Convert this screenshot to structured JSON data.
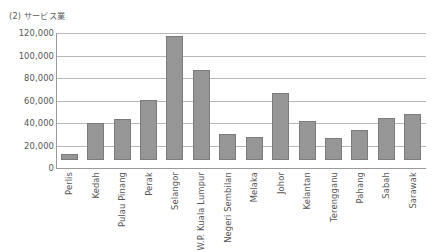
{
  "chart_data": {
    "type": "bar",
    "title": "(2) サービス業",
    "xlabel": "",
    "ylabel": "",
    "ylim": [
      0,
      120000
    ],
    "ytick_labels": [
      "120,000",
      "100,000",
      "80,000",
      "60,000",
      "40,000",
      "20,000",
      "0"
    ],
    "ytick_values": [
      120000,
      100000,
      80000,
      60000,
      40000,
      20000,
      0
    ],
    "grid": true,
    "legend": "none",
    "bar_color": "#969696",
    "bar_edge_color": "#7b7b7b",
    "categories": [
      "Perlis",
      "Kedah",
      "Pulau Pinang",
      "Perak",
      "Selangor",
      "W.P. Kuala Lumpur",
      "Negeri Sembilan",
      "Melaka",
      "Johor",
      "Kelantan",
      "Terengganu",
      "Pahang",
      "Sabah",
      "Sarawak"
    ],
    "values": [
      5000,
      33000,
      36500,
      53500,
      110500,
      80000,
      23000,
      20500,
      60000,
      35000,
      19500,
      26500,
      37500,
      40500
    ]
  },
  "source_note": ""
}
